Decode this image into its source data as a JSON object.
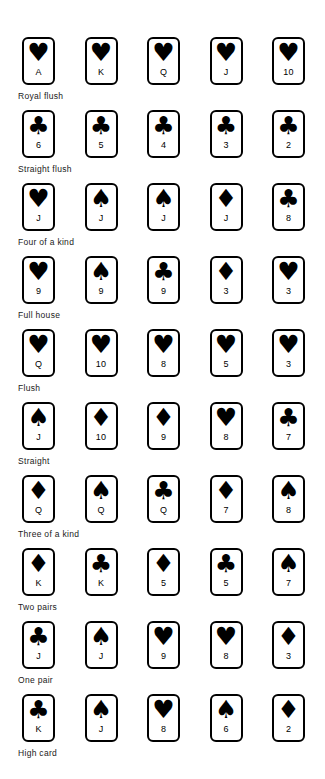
{
  "diagram": {
    "suit_glyphs": {
      "hearts": "♥",
      "spades": "♠",
      "clubs": "♣",
      "diamonds": "♦"
    },
    "ink_color": "#000000",
    "background_color": "#ffffff",
    "rows": [
      {
        "label": "Royal flush",
        "cards": [
          {
            "rank": "A",
            "suit": "hearts"
          },
          {
            "rank": "K",
            "suit": "hearts"
          },
          {
            "rank": "Q",
            "suit": "hearts"
          },
          {
            "rank": "J",
            "suit": "hearts"
          },
          {
            "rank": "10",
            "suit": "hearts"
          }
        ]
      },
      {
        "label": "Straight flush",
        "cards": [
          {
            "rank": "6",
            "suit": "clubs"
          },
          {
            "rank": "5",
            "suit": "clubs"
          },
          {
            "rank": "4",
            "suit": "clubs"
          },
          {
            "rank": "3",
            "suit": "clubs"
          },
          {
            "rank": "2",
            "suit": "clubs"
          }
        ]
      },
      {
        "label": "Four of a kind",
        "cards": [
          {
            "rank": "J",
            "suit": "hearts"
          },
          {
            "rank": "J",
            "suit": "spades"
          },
          {
            "rank": "J",
            "suit": "spades"
          },
          {
            "rank": "J",
            "suit": "diamonds"
          },
          {
            "rank": "8",
            "suit": "clubs"
          }
        ]
      },
      {
        "label": "Full house",
        "cards": [
          {
            "rank": "9",
            "suit": "hearts"
          },
          {
            "rank": "9",
            "suit": "spades"
          },
          {
            "rank": "9",
            "suit": "clubs"
          },
          {
            "rank": "3",
            "suit": "diamonds"
          },
          {
            "rank": "3",
            "suit": "hearts"
          }
        ]
      },
      {
        "label": "Flush",
        "cards": [
          {
            "rank": "Q",
            "suit": "hearts"
          },
          {
            "rank": "10",
            "suit": "hearts"
          },
          {
            "rank": "8",
            "suit": "hearts"
          },
          {
            "rank": "5",
            "suit": "hearts"
          },
          {
            "rank": "3",
            "suit": "hearts"
          }
        ]
      },
      {
        "label": "Straight",
        "cards": [
          {
            "rank": "J",
            "suit": "spades"
          },
          {
            "rank": "10",
            "suit": "diamonds"
          },
          {
            "rank": "9",
            "suit": "diamonds"
          },
          {
            "rank": "8",
            "suit": "hearts"
          },
          {
            "rank": "7",
            "suit": "clubs"
          }
        ]
      },
      {
        "label": "Three of a kind",
        "cards": [
          {
            "rank": "Q",
            "suit": "diamonds"
          },
          {
            "rank": "Q",
            "suit": "spades"
          },
          {
            "rank": "Q",
            "suit": "clubs"
          },
          {
            "rank": "7",
            "suit": "diamonds"
          },
          {
            "rank": "8",
            "suit": "spades"
          }
        ]
      },
      {
        "label": "Two pairs",
        "cards": [
          {
            "rank": "K",
            "suit": "diamonds"
          },
          {
            "rank": "K",
            "suit": "clubs"
          },
          {
            "rank": "5",
            "suit": "diamonds"
          },
          {
            "rank": "5",
            "suit": "clubs"
          },
          {
            "rank": "7",
            "suit": "spades"
          }
        ]
      },
      {
        "label": "One pair",
        "cards": [
          {
            "rank": "J",
            "suit": "clubs"
          },
          {
            "rank": "J",
            "suit": "spades"
          },
          {
            "rank": "9",
            "suit": "hearts"
          },
          {
            "rank": "8",
            "suit": "hearts"
          },
          {
            "rank": "3",
            "suit": "diamonds"
          }
        ]
      },
      {
        "label": "High card",
        "cards": [
          {
            "rank": "K",
            "suit": "clubs"
          },
          {
            "rank": "J",
            "suit": "spades"
          },
          {
            "rank": "8",
            "suit": "hearts"
          },
          {
            "rank": "6",
            "suit": "spades"
          },
          {
            "rank": "2",
            "suit": "diamonds"
          }
        ]
      }
    ]
  }
}
